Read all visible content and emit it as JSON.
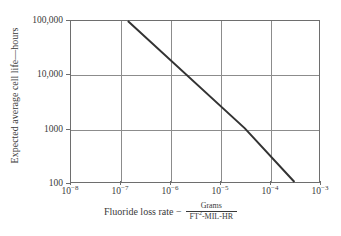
{
  "chart_data": {
    "type": "line",
    "title": "",
    "subtitle": "",
    "xlabel_prefix": "Fluoride loss rate −",
    "xlabel_fraction_numerator": "Grams",
    "xlabel_fraction_denominator_base": "FT",
    "xlabel_fraction_denominator_exponent": "2",
    "xlabel_fraction_denominator_rest": "-MIL-HR",
    "ylabel": "Expected average cell life—hours",
    "xscale": "log",
    "yscale": "log",
    "xlim": [
      1e-08,
      0.001
    ],
    "ylim": [
      100,
      100000
    ],
    "grid": true,
    "legend": false,
    "x_ticks": [
      {
        "value": 1e-08,
        "base": "10",
        "exponent": "−8"
      },
      {
        "value": 1e-07,
        "base": "10",
        "exponent": "−7"
      },
      {
        "value": 1e-06,
        "base": "10",
        "exponent": "−6"
      },
      {
        "value": 1e-05,
        "base": "10",
        "exponent": "−5"
      },
      {
        "value": 0.0001,
        "base": "10",
        "exponent": "−4"
      },
      {
        "value": 0.001,
        "base": "10",
        "exponent": "−3"
      }
    ],
    "y_ticks": [
      {
        "value": 100000,
        "label": "100,000"
      },
      {
        "value": 10000,
        "label": "10,000"
      },
      {
        "value": 1000,
        "label": "1000"
      },
      {
        "value": 100,
        "label": "100"
      }
    ],
    "series": [
      {
        "name": "expected cell life vs fluoride loss rate",
        "color": "#333333",
        "line_width": 2,
        "points": [
          {
            "x": 1.4e-07,
            "y": 100000
          },
          {
            "x": 3.2e-05,
            "y": 1000
          },
          {
            "x": 0.00032,
            "y": 100
          }
        ]
      }
    ],
    "line_color": "#333333",
    "grid_color": "#8c8c8c",
    "frame_color": "#6e6e6e",
    "background_color": "#ffffff",
    "text_color": "#3a3a3a"
  }
}
